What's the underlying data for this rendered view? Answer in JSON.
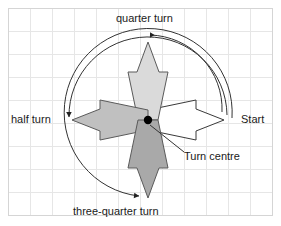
{
  "figure": {
    "title_semantic": "rotation-turns-diagram",
    "background_color": "#ffffff",
    "grid": {
      "line_color": "#e3e3e3",
      "frame_color": "#d8d8d8",
      "cell_size_px": 22,
      "origin_x_px": 8,
      "origin_y_px": 8,
      "columns": 12,
      "rows": 9
    },
    "turn_centre": {
      "x_px": 148,
      "y_px": 120,
      "dot_color": "#000000",
      "dot_radius_px": 4
    },
    "arrows": [
      {
        "id": "start-arrow",
        "direction": "right",
        "label_ref": "start",
        "fill": "#ffffff",
        "stroke": "#333333"
      },
      {
        "id": "quarter-turn-arrow",
        "direction": "up",
        "label_ref": "quarter_turn",
        "fill": "#d8d8d8",
        "stroke": "#555555"
      },
      {
        "id": "half-turn-arrow",
        "direction": "left",
        "label_ref": "half_turn",
        "fill": "#bfbfbf",
        "stroke": "#555555"
      },
      {
        "id": "three-quarter-turn-arrow",
        "direction": "down",
        "label_ref": "three_quarter_turn",
        "fill": "#a8a8a8",
        "stroke": "#555555"
      }
    ],
    "arcs": [
      {
        "id": "arc-quarter-turn",
        "from": "start",
        "to": "quarter turn",
        "sweep": "anticlockwise",
        "stroke": "#333333"
      },
      {
        "id": "arc-half-turn",
        "from": "start",
        "to": "half turn",
        "sweep": "anticlockwise",
        "stroke": "#333333"
      },
      {
        "id": "arc-three-quarter-turn",
        "from": "start",
        "to": "three-quarter turn",
        "sweep": "anticlockwise",
        "stroke": "#333333"
      }
    ],
    "labels": {
      "quarter_turn": "quarter turn",
      "half_turn": "half turn",
      "three_quarter_turn": "three-quarter turn",
      "start": "Start",
      "turn_centre": "Turn centre"
    },
    "leader_line": {
      "id": "turn-centre-leader",
      "from_x_px": 149,
      "from_y_px": 126,
      "to_x_px": 183,
      "to_y_px": 153,
      "stroke": "#333333"
    }
  }
}
